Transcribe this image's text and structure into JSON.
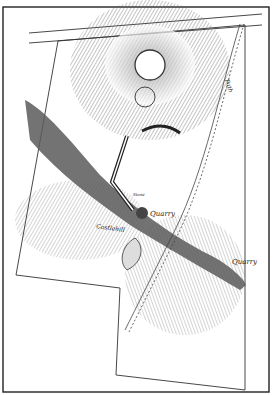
{
  "map": {
    "kind": "engraved hachure plan of hillfort",
    "colors": {
      "ink": "#2a2a2a",
      "paper": "#ffffff",
      "hachure": "#555555"
    },
    "labels": {
      "quarry_upper": "Quarry",
      "quarry_lower": "Quarry",
      "castle_hill": "Castlehill",
      "path": "Path",
      "stone": "Stone"
    }
  }
}
